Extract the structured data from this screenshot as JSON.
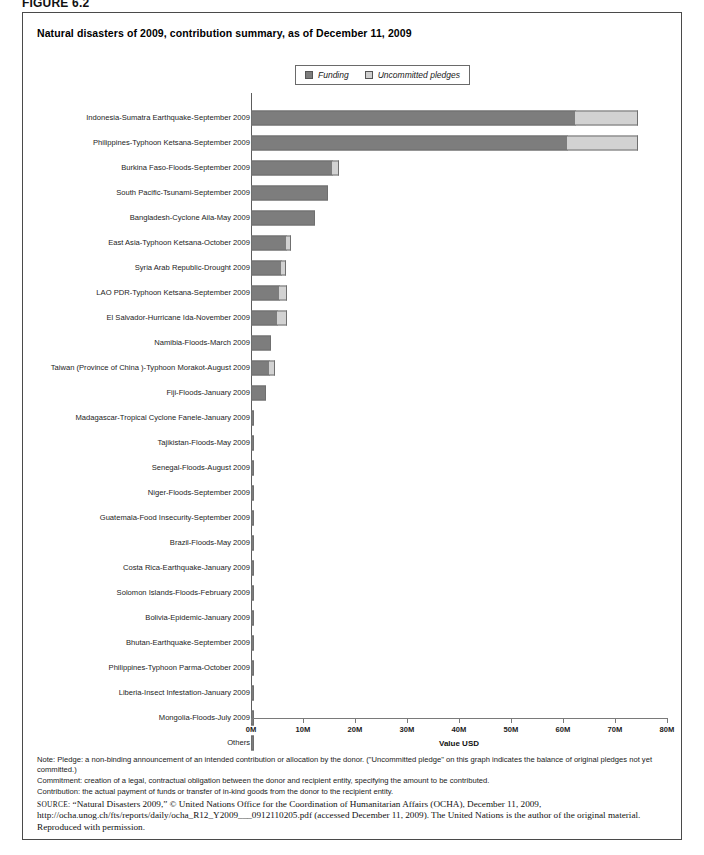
{
  "figure_label": "FIGURE 6.2",
  "chart_title": "Natural disasters of 2009, contribution summary, as of December 11, 2009",
  "legend": {
    "funding_label": "Funding",
    "pledges_label": "Uncommitted pledges",
    "funding_color": "#7d7d7d",
    "pledges_color": "#d2d2d2"
  },
  "notes": {
    "line1": "Note: Pledge: a non-binding announcement of an intended contribution or allocation by the donor. (\"Uncommitted pledge\" on this graph indicates the balance of original pledges not yet committed.)",
    "line2": "Commitment: creation of a legal, contractual obligation between the donor and recipient entity, specifying the amount to be contributed.",
    "line3": "Contribution: the actual payment of funds or transfer of in-kind goods from the donor to the recipient entity."
  },
  "source": {
    "prefix": "SOURCE:",
    "text": " “Natural Disasters 2009,” © United Nations Office for the Coordination of Humanitarian Affairs (OCHA), December 11, 2009, http://ocha.unog.ch/fts/reports/daily/ocha_R12_Y2009___0912110205.pdf (accessed December 11, 2009). The United Nations is the author of the original material. Reproduced with permission."
  },
  "chart_data": {
    "type": "bar",
    "orientation": "horizontal",
    "stacked": true,
    "title": "Natural disasters of 2009, contribution summary, as of December 11, 2009",
    "xlabel": "Value USD",
    "ylabel": "",
    "xlim": [
      0,
      80
    ],
    "xunit": "millions USD",
    "xticks": [
      0,
      10,
      20,
      30,
      40,
      50,
      60,
      70,
      80
    ],
    "xticklabels": [
      "0M",
      "10M",
      "20M",
      "30M",
      "40M",
      "50M",
      "60M",
      "70M",
      "80M"
    ],
    "grid": false,
    "legend_position": "top-right",
    "series": [
      {
        "name": "Funding",
        "color": "#7d7d7d"
      },
      {
        "name": "Uncommitted pledges",
        "color": "#d2d2d2"
      }
    ],
    "categories": [
      "Indonesia-Sumatra Earthquake-September 2009",
      "Philippines-Typhoon Ketsana-September 2009",
      "Burkina Faso-Floods-September 2009",
      "South Pacific-Tsunami-September 2009",
      "Bangladesh-Cyclone Aila-May 2009",
      "East Asia-Typhoon Ketsana-October 2009",
      "Syria Arab Republic-Drought 2009",
      "LAO PDR-Typhoon Ketsana-September 2009",
      "El Salvador-Hurricane Ida-November 2009",
      "Namibia-Floods-March 2009",
      "Taiwan (Province of China )-Typhoon Morakot-August 2009",
      "Fiji-Floods-January 2009",
      "Madagascar-Tropical Cyclone Fanele-January 2009",
      "Tajikistan-Floods-May 2009",
      "Senegal-Floods-August 2009",
      "Niger-Floods-September 2009",
      "Guatemala-Food Insecurity-September 2009",
      "Brazil-Floods-May 2009",
      "Costa Rica-Earthquake-January 2009",
      "Solomon Islands-Floods-February 2009",
      "Bolivia-Epidemic-January 2009",
      "Bhutan-Earthquake-September 2009",
      "Philippines-Typhoon Parma-October 2009",
      "Liberia-Insect Infestation-January 2009",
      "Mongolia-Floods-July 2009",
      "Others"
    ],
    "funding": [
      62.5,
      61.0,
      15.8,
      14.8,
      12.3,
      6.9,
      6.0,
      5.6,
      5.2,
      3.8,
      3.7,
      2.9,
      0.6,
      0.5,
      0.5,
      0.5,
      0.45,
      0.45,
      0.4,
      0.4,
      0.3,
      0.3,
      0.25,
      0.25,
      0.2,
      0.5
    ],
    "uncommitted_pledges": [
      12.1,
      13.6,
      1.3,
      0.0,
      0.0,
      1.0,
      0.9,
      1.5,
      1.9,
      0.0,
      1.1,
      0.0,
      0.0,
      0.0,
      0.0,
      0.0,
      0.0,
      0.0,
      0.0,
      0.0,
      0.0,
      0.0,
      0.0,
      0.0,
      0.0,
      0.0
    ]
  }
}
